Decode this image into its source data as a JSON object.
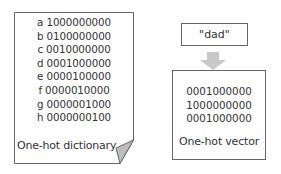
{
  "dictionary": {
    "entries": [
      "a 1000000000",
      "b 0100000000",
      "c 0010000000",
      "d 0001000000",
      "e 0000100000",
      "f 0000010000",
      "g 0000001000",
      "h 0000000100"
    ],
    "label": "One-hot dictionary"
  },
  "input_word": "\"dad\"",
  "vector": {
    "rows": [
      "0001000000",
      "1000000000",
      "0001000000"
    ],
    "label": "One-hot vector"
  },
  "colors": {
    "border": "#666666",
    "arrow": "#c8c8c8",
    "fold": "#bdbdbd",
    "text": "#333333"
  }
}
